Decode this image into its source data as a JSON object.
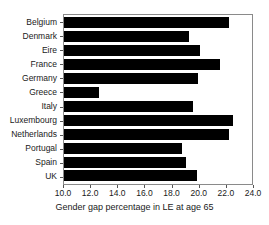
{
  "chart_data": {
    "type": "bar",
    "orientation": "horizontal",
    "title": "",
    "xlabel": "Gender gap percentage in LE at age 65",
    "ylabel": "",
    "xlim": [
      10.0,
      24.0
    ],
    "xticks": [
      "10.0",
      "12.0",
      "14.0",
      "16.0",
      "18.0",
      "20.0",
      "22.0",
      "24.0"
    ],
    "xtick_values": [
      10.0,
      12.0,
      14.0,
      16.0,
      18.0,
      20.0,
      22.0,
      24.0
    ],
    "grid": false,
    "legend": false,
    "bar_color": "#000000",
    "frame_color": "#8a8a8a",
    "categories": [
      "Belgium",
      "Denmark",
      "Eire",
      "France",
      "Germany",
      "Greece",
      "Italy",
      "Luxembourg",
      "Netherlands",
      "Portugal",
      "Spain",
      "UK"
    ],
    "values": [
      22.3,
      19.3,
      20.1,
      21.6,
      20.0,
      12.6,
      19.6,
      22.6,
      22.3,
      18.8,
      19.1,
      19.9
    ]
  }
}
